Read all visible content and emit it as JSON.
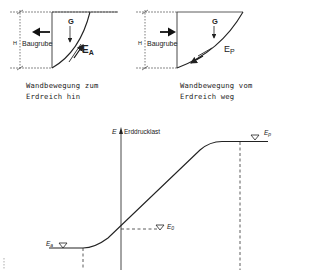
{
  "left_panel": {
    "height_label": "H",
    "pit_label": "Baugrube",
    "weight_label": "G",
    "force_label_main": "E",
    "force_label_sub": "A",
    "caption_line1": "Wandbewegung zum",
    "caption_line2": "Erdreich hin",
    "wall_motion": "toward-pit (left)"
  },
  "right_panel": {
    "height_label": "H",
    "pit_label": "Baugrube",
    "weight_label": "G",
    "force_label_main": "E",
    "force_label_sub": "P",
    "caption_line1": "Wandbewegung vom",
    "caption_line2": "Erdreich weg",
    "wall_motion": "toward-soil (right)"
  },
  "graph": {
    "axis_symbol": "E",
    "axis_label": "Erddrucklast",
    "levels": [
      {
        "symbol": "E",
        "sub": "a",
        "name": "active earth pressure"
      },
      {
        "symbol": "E",
        "sub": "0",
        "name": "earth pressure at rest"
      },
      {
        "symbol": "E",
        "sub": "p",
        "name": "passive earth pressure"
      }
    ]
  }
}
